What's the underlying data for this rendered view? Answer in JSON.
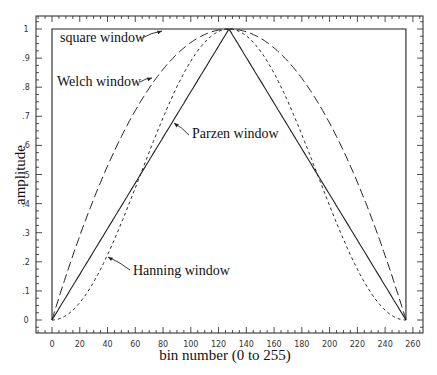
{
  "chart_data": {
    "type": "line",
    "title": "",
    "xlabel": "bin number (0 to 255)",
    "ylabel": "amplitude",
    "xlim": [
      -10,
      265
    ],
    "ylim": [
      -0.05,
      1.04
    ],
    "x_ticks": [
      "0",
      "20",
      "40",
      "60",
      "80",
      "100",
      "120",
      "140",
      "160",
      "180",
      "200",
      "220",
      "240",
      "260"
    ],
    "y_ticks": [
      "0",
      ".1",
      ".2",
      ".3",
      ".4",
      ".5",
      ".6",
      ".7",
      ".8",
      ".9",
      "1"
    ],
    "grid": false,
    "legend": "annotations with arrows",
    "series": [
      {
        "name": "square window",
        "style": "solid",
        "formula": "1 for 0<=n<=255"
      },
      {
        "name": "Parzen window",
        "style": "solid",
        "formula": "1 - |n-127.5|/127.5"
      },
      {
        "name": "Welch window",
        "style": "long-dash",
        "formula": "1 - ((n-127.5)/127.5)^2"
      },
      {
        "name": "Hanning window",
        "style": "short-dash",
        "formula": "0.5*(1 - cos(2*pi*n/255))"
      }
    ],
    "annotations": [
      {
        "text": "square window"
      },
      {
        "text": "Welch window"
      },
      {
        "text": "Parzen window"
      },
      {
        "text": "Hanning window"
      }
    ]
  }
}
